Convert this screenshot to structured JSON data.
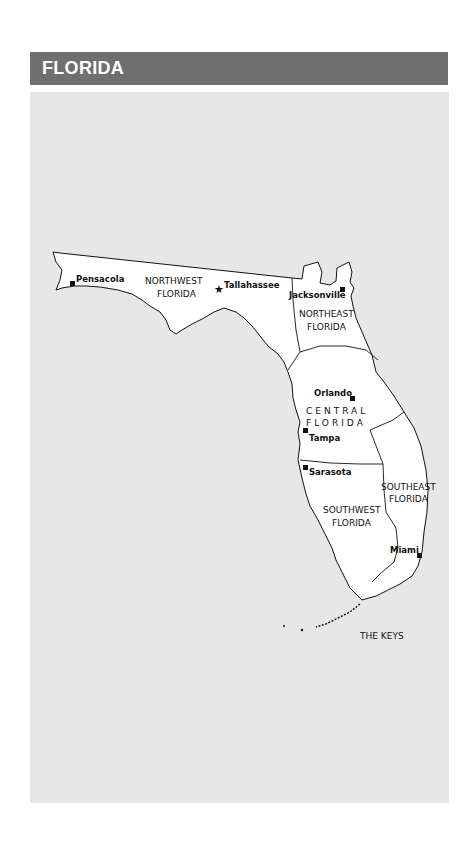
{
  "header": {
    "title": "FLORIDA",
    "background_color": "#6f6f6f",
    "text_color": "#ffffff"
  },
  "map": {
    "background_color": "#e7e7e7",
    "land_color": "#ffffff",
    "regions": [
      {
        "id": "northwest",
        "line1": "NORTHWEST",
        "line2": "FLORIDA"
      },
      {
        "id": "northeast",
        "line1": "NORTHEAST",
        "line2": "FLORIDA"
      },
      {
        "id": "central",
        "line1": "CENTRAL",
        "line2": "FLORIDA"
      },
      {
        "id": "southwest",
        "line1": "SOUTHWEST",
        "line2": "FLORIDA"
      },
      {
        "id": "southeast",
        "line1": "SOUTHEAST",
        "line2": "FLORIDA"
      },
      {
        "id": "keys",
        "line1": "THE KEYS"
      }
    ],
    "cities": [
      {
        "name": "Pensacola",
        "marker": "square"
      },
      {
        "name": "Tallahassee",
        "marker": "star"
      },
      {
        "name": "Jacksonville",
        "marker": "square"
      },
      {
        "name": "Orlando",
        "marker": "square"
      },
      {
        "name": "Tampa",
        "marker": "square"
      },
      {
        "name": "Sarasota",
        "marker": "square"
      },
      {
        "name": "Miami",
        "marker": "square"
      }
    ]
  }
}
